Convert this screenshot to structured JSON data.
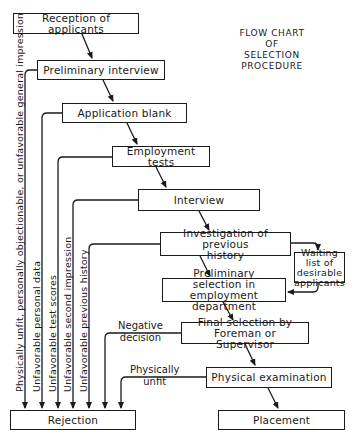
{
  "title": "FLOW CHART\nOF\nSELECTION PROCEDURE",
  "boxes": {
    "reception": "Reception of applicants",
    "preliminary_interview": "Preliminary interview",
    "application_blank": "Application blank",
    "employment_tests": "Employment tests",
    "interview": "Interview",
    "investigation": "Investigation of previous history",
    "waiting_list": "Waiting list of desirable applicants",
    "preliminary_selection": "Preliminary selection in employment department",
    "final_selection": "Final selection by Foreman or Supervisor",
    "physical_exam": "Physical examination",
    "placement": "Placement",
    "rejection": "Rejection"
  },
  "rejection_reasons": [
    "Physically unfit, personally objectionable, or unfavorable general impression",
    "Unfavorable personal data",
    "Unfavorable test scores",
    "Unfavorable second impression",
    "Unfavorable previous history"
  ],
  "side_labels": {
    "negative_decision": "Negative\ndecision",
    "physically_unfit": "Physically\nunfit"
  },
  "colors": {
    "line": "#1a1a1a",
    "background": "#ffffff"
  }
}
